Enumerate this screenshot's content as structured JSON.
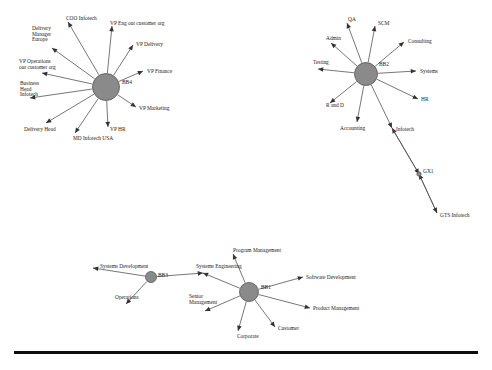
{
  "figure": {
    "node_fill_color": "#8a8a8a",
    "node_stroke_color": "#545454",
    "edge_color": "#4a4a4a",
    "arrow_color": "#333333",
    "text_color": "#1b1b1b",
    "background_color": "#ffffff",
    "rule_color": "#0d0d0d"
  },
  "networks": [
    {
      "id": "network-bb4",
      "hub": {
        "label": "BB4",
        "x": 106,
        "y": 87,
        "r": 13.5,
        "label_x": 122,
        "label_y": 84
      },
      "leaves": [
        {
          "label": "COO Infotech",
          "x": 68,
          "y": 22,
          "tx": 66,
          "ty": 20,
          "anchor": "start"
        },
        {
          "label": "VP Eng out customer org",
          "x": 112,
          "y": 26,
          "tx": 110,
          "ty": 25,
          "anchor": "start"
        },
        {
          "label": "VP Delivery",
          "x": 133,
          "y": 45,
          "tx": 136,
          "ty": 46,
          "anchor": "start"
        },
        {
          "label": "VP Finance",
          "x": 143,
          "y": 71,
          "tx": 147,
          "ty": 73,
          "anchor": "start"
        },
        {
          "label": "VP Marketing",
          "x": 136,
          "y": 107,
          "tx": 139,
          "ty": 110,
          "anchor": "start"
        },
        {
          "label": "VP HR",
          "x": 108,
          "y": 127,
          "tx": 110,
          "ty": 131,
          "anchor": "start"
        },
        {
          "label": "MD Infotech USA",
          "x": 75,
          "y": 133,
          "tx": 73,
          "ty": 140,
          "anchor": "start"
        },
        {
          "label": "Delivery Head",
          "x": 46,
          "y": 123,
          "tx": 24,
          "ty": 131,
          "anchor": "start"
        },
        {
          "label": "Business Head Infotech",
          "x": 30,
          "y": 98,
          "tx": 20,
          "ty": 85,
          "anchor": "start",
          "lines": [
            "Business",
            "Head",
            "Infotech"
          ]
        },
        {
          "label": "VP Operations our customer org",
          "x": 42,
          "y": 73,
          "tx": 19,
          "ty": 63,
          "anchor": "start",
          "lines": [
            "VP Operations",
            "our customer org"
          ]
        },
        {
          "label": "Delivery Manager Europe",
          "x": 52,
          "y": 48,
          "tx": 32,
          "ty": 30,
          "anchor": "start",
          "lines": [
            "Delivery",
            "Manager",
            "Europe"
          ]
        }
      ]
    },
    {
      "id": "network-bb2",
      "hub": {
        "label": "BB2",
        "x": 366,
        "y": 74,
        "r": 11.5,
        "label_x": 379,
        "label_y": 66
      },
      "leaves": [
        {
          "label": "QA",
          "x": 347,
          "y": 23,
          "tx": 348,
          "ty": 21,
          "anchor": "start"
        },
        {
          "label": "SCM",
          "x": 375,
          "y": 26,
          "tx": 378,
          "ty": 25,
          "anchor": "start"
        },
        {
          "label": "Consulting",
          "x": 404,
          "y": 42,
          "tx": 408,
          "ty": 43,
          "anchor": "start"
        },
        {
          "label": "Systems",
          "x": 416,
          "y": 71,
          "tx": 420,
          "ty": 73,
          "anchor": "start"
        },
        {
          "label": "HR",
          "x": 418,
          "y": 99,
          "tx": 421,
          "ty": 101,
          "anchor": "start"
        },
        {
          "label": "Infotech",
          "x": 392,
          "y": 128,
          "tx": 396,
          "ty": 131,
          "anchor": "start"
        },
        {
          "label": "Accounting",
          "x": 357,
          "y": 122,
          "tx": 340,
          "ty": 130,
          "anchor": "start"
        },
        {
          "label": "R and D",
          "x": 330,
          "y": 103,
          "tx": 326,
          "ty": 107,
          "anchor": "start"
        },
        {
          "label": "Testing",
          "x": 318,
          "y": 69,
          "tx": 313,
          "ty": 64,
          "anchor": "start"
        },
        {
          "label": "Admin",
          "x": 331,
          "y": 43,
          "tx": 326,
          "ty": 40,
          "anchor": "start"
        }
      ],
      "chain": [
        {
          "from_label": "Infotech",
          "to_label": "GX1",
          "x": 419,
          "y": 174,
          "tx": 423,
          "ty": 173,
          "node": true
        },
        {
          "from_label": "GX1",
          "to_label": "GTS Infotech",
          "x": 437,
          "y": 213,
          "tx": 440,
          "ty": 217,
          "node": false
        }
      ]
    },
    {
      "id": "network-bb1",
      "hub": {
        "label": "BB1",
        "x": 249,
        "y": 292,
        "r": 9.5,
        "label_x": 261,
        "label_y": 289
      },
      "leaves": [
        {
          "label": "Program Management",
          "x": 233,
          "y": 254,
          "tx": 233,
          "ty": 252,
          "anchor": "start"
        },
        {
          "label": "Software Development",
          "x": 303,
          "y": 277,
          "tx": 306,
          "ty": 279,
          "anchor": "start"
        },
        {
          "label": "Product Management",
          "x": 310,
          "y": 308,
          "tx": 313,
          "ty": 310,
          "anchor": "start"
        },
        {
          "label": "Customer",
          "x": 275,
          "y": 327,
          "tx": 278,
          "ty": 330,
          "anchor": "start"
        },
        {
          "label": "Corporate",
          "x": 238,
          "y": 331,
          "tx": 237,
          "ty": 338,
          "anchor": "start"
        },
        {
          "label": "Senior Management",
          "x": 205,
          "y": 311,
          "tx": 189,
          "ty": 298,
          "anchor": "start",
          "lines": [
            "Senior",
            "Management"
          ]
        },
        {
          "label": "Systems Engineering",
          "x": 203,
          "y": 273,
          "tx": 196,
          "ty": 268,
          "anchor": "start"
        }
      ],
      "sub_hub": {
        "label": "BB3",
        "x": 151,
        "y": 277,
        "r": 5.5,
        "label_x": 158,
        "label_y": 277,
        "leaves": [
          {
            "label": "Systems Development",
            "x": 93,
            "y": 268,
            "tx": 100,
            "ty": 268,
            "anchor": "start"
          },
          {
            "label": "Operations",
            "x": 126,
            "y": 304,
            "tx": 115,
            "ty": 299,
            "anchor": "start"
          }
        ],
        "link_to_label": "Systems Engineering"
      }
    }
  ]
}
